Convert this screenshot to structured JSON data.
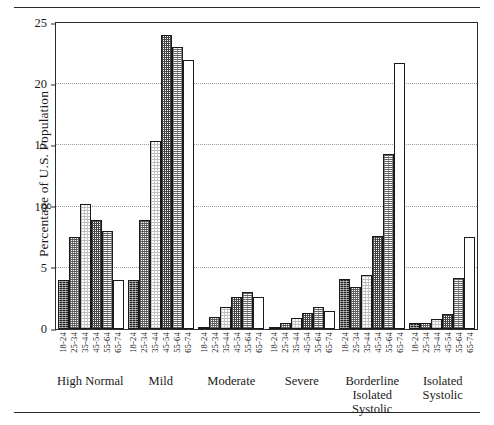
{
  "chart_data": {
    "type": "bar",
    "title": "",
    "xlabel": "",
    "ylabel": "Percentage of U.S. Population",
    "ylim": [
      0,
      25
    ],
    "yticks": [
      0,
      5,
      10,
      15,
      20,
      25
    ],
    "grid": true,
    "legend_position": "none",
    "categories": [
      "High Normal",
      "Mild",
      "Moderate",
      "Severe",
      "Borderline Isolated Systolic",
      "Isolated Systolic"
    ],
    "category_lines": [
      [
        "High Normal"
      ],
      [
        "Mild"
      ],
      [
        "Moderate"
      ],
      [
        "Severe"
      ],
      [
        "Borderline",
        "Isolated",
        "Systolic"
      ],
      [
        "Isolated",
        "Systolic"
      ]
    ],
    "age_groups": [
      "18-24",
      "25-34",
      "35-44",
      "45-54",
      "55-64",
      "65-74"
    ],
    "series": [
      {
        "name": "18-24",
        "values": [
          4.0,
          4.0,
          0.15,
          0.2,
          4.1,
          0.5
        ]
      },
      {
        "name": "25-34",
        "values": [
          7.5,
          8.9,
          1.0,
          0.5,
          3.4,
          0.5
        ]
      },
      {
        "name": "35-44",
        "values": [
          10.2,
          15.4,
          1.8,
          0.9,
          4.4,
          0.8
        ]
      },
      {
        "name": "45-54",
        "values": [
          8.9,
          24.0,
          2.6,
          1.3,
          7.6,
          1.2
        ]
      },
      {
        "name": "55-64",
        "values": [
          8.0,
          23.0,
          3.0,
          1.8,
          14.3,
          4.2
        ]
      },
      {
        "name": "65-74",
        "values": [
          4.0,
          22.0,
          2.6,
          1.5,
          21.7,
          7.5
        ]
      }
    ]
  }
}
